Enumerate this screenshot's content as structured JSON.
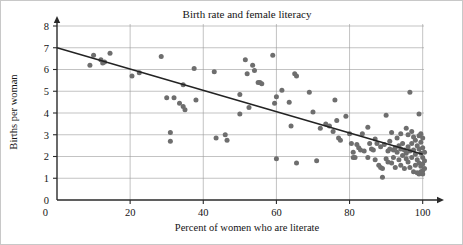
{
  "chart_data": {
    "type": "scatter",
    "title": "Birth rate and female literacy",
    "xlabel": "Percent of women who are literate",
    "ylabel": "Births per woman",
    "xlim": [
      0,
      102
    ],
    "ylim": [
      0,
      8.3
    ],
    "xticks": [
      0,
      20,
      40,
      60,
      80,
      100
    ],
    "yticks": [
      0,
      1,
      2,
      3,
      4,
      5,
      6,
      7,
      8
    ],
    "xtick_labels": [
      "0",
      "20",
      "40",
      "60",
      "80",
      "100"
    ],
    "ytick_labels": [
      "0",
      "1",
      "2",
      "3",
      "4",
      "5",
      "6",
      "7",
      "8"
    ],
    "grid": "horizontal-and-vertical",
    "legend": "none",
    "point_color": "#6e6e6e",
    "line_color": "#232323",
    "trend_line": {
      "label": "least-squares regression line",
      "x_start": 0,
      "y_start": 7.0,
      "x_end": 100,
      "y_end": 2.1,
      "slope": -0.049,
      "intercept": 7.0
    },
    "points": [
      [
        9,
        6.2
      ],
      [
        10,
        6.65
      ],
      [
        12,
        6.45
      ],
      [
        12.5,
        6.3
      ],
      [
        13,
        6.35
      ],
      [
        14.5,
        6.75
      ],
      [
        20.5,
        5.7
      ],
      [
        22.5,
        5.85
      ],
      [
        28.5,
        6.6
      ],
      [
        30,
        4.7
      ],
      [
        31,
        3.1
      ],
      [
        31,
        2.7
      ],
      [
        32,
        4.7
      ],
      [
        33.5,
        4.45
      ],
      [
        34.5,
        5.3
      ],
      [
        34.5,
        4.3
      ],
      [
        35,
        4.15
      ],
      [
        37.5,
        6.05
      ],
      [
        38,
        4.6
      ],
      [
        43,
        5.9
      ],
      [
        43.5,
        2.85
      ],
      [
        46,
        3.0
      ],
      [
        46.5,
        2.75
      ],
      [
        50,
        4.85
      ],
      [
        50,
        3.95
      ],
      [
        51.5,
        6.45
      ],
      [
        52,
        5.8
      ],
      [
        52.5,
        4.25
      ],
      [
        53.5,
        6.2
      ],
      [
        54,
        5.95
      ],
      [
        55,
        5.4
      ],
      [
        55.5,
        5.4
      ],
      [
        56,
        5.35
      ],
      [
        59,
        6.65
      ],
      [
        59.5,
        4.45
      ],
      [
        60,
        4.75
      ],
      [
        60,
        1.9
      ],
      [
        61.5,
        5.05
      ],
      [
        63.5,
        4.5
      ],
      [
        64,
        3.4
      ],
      [
        65,
        5.8
      ],
      [
        65.5,
        5.7
      ],
      [
        65.5,
        1.7
      ],
      [
        69,
        4.95
      ],
      [
        70,
        4.05
      ],
      [
        71,
        1.8
      ],
      [
        72,
        3.3
      ],
      [
        73.5,
        3.5
      ],
      [
        74.5,
        3.4
      ],
      [
        75.5,
        3.15
      ],
      [
        76,
        4.6
      ],
      [
        76.5,
        3.65
      ],
      [
        77,
        2.85
      ],
      [
        77.5,
        2.75
      ],
      [
        79,
        3.85
      ],
      [
        80,
        3.05
      ],
      [
        80.5,
        2.6
      ],
      [
        81,
        2.2
      ],
      [
        81,
        1.95
      ],
      [
        81.5,
        1.95
      ],
      [
        82,
        2.55
      ],
      [
        82.5,
        2.4
      ],
      [
        83,
        2.3
      ],
      [
        83.5,
        3.05
      ],
      [
        84,
        2.25
      ],
      [
        85,
        3.35
      ],
      [
        85.5,
        2.6
      ],
      [
        86,
        2.35
      ],
      [
        86.5,
        2.3
      ],
      [
        87,
        1.85
      ],
      [
        87.5,
        2.6
      ],
      [
        88,
        1.6
      ],
      [
        88.5,
        1.5
      ],
      [
        88.5,
        2.45
      ],
      [
        89,
        1.05
      ],
      [
        89,
        1.45
      ],
      [
        89.5,
        2.55
      ],
      [
        90,
        3.9
      ],
      [
        90,
        1.9
      ],
      [
        90.5,
        2.25
      ],
      [
        90.5,
        1.75
      ],
      [
        91,
        2.7
      ],
      [
        91,
        2.35
      ],
      [
        91.5,
        3.1
      ],
      [
        91.5,
        1.7
      ],
      [
        92,
        2.3
      ],
      [
        92,
        1.95
      ],
      [
        92.5,
        2.4
      ],
      [
        92.5,
        1.5
      ],
      [
        93,
        2.85
      ],
      [
        93,
        2.2
      ],
      [
        93.5,
        2.5
      ],
      [
        93.5,
        1.85
      ],
      [
        94,
        2.35
      ],
      [
        94,
        1.6
      ],
      [
        94.5,
        2.6
      ],
      [
        94.5,
        2.05
      ],
      [
        95,
        2.3
      ],
      [
        95,
        1.45
      ],
      [
        95.5,
        3.3
      ],
      [
        95.5,
        2.15
      ],
      [
        95.5,
        1.9
      ],
      [
        96,
        2.45
      ],
      [
        96,
        1.75
      ],
      [
        96.5,
        4.95
      ],
      [
        96.5,
        2.25
      ],
      [
        96.5,
        1.5
      ],
      [
        97,
        3.15
      ],
      [
        97,
        2.6
      ],
      [
        97,
        1.95
      ],
      [
        97.5,
        2.9
      ],
      [
        97.5,
        2.3
      ],
      [
        97.5,
        1.3
      ],
      [
        98,
        2.75
      ],
      [
        98,
        2.1
      ],
      [
        98,
        1.6
      ],
      [
        98.5,
        2.5
      ],
      [
        98.5,
        1.85
      ],
      [
        98.5,
        1.25
      ],
      [
        99,
        3.95
      ],
      [
        99,
        2.95
      ],
      [
        99,
        2.35
      ],
      [
        99,
        1.7
      ],
      [
        99,
        1.2
      ],
      [
        99.5,
        2.65
      ],
      [
        99.5,
        2.15
      ],
      [
        99.5,
        1.55
      ],
      [
        99.5,
        1.3
      ],
      [
        100,
        2.85
      ],
      [
        100,
        2.4
      ],
      [
        100,
        1.95
      ],
      [
        100,
        1.65
      ],
      [
        100,
        1.35
      ],
      [
        100,
        1.2
      ],
      [
        100.5,
        2.2
      ],
      [
        100.5,
        1.8
      ],
      [
        100.5,
        1.45
      ],
      [
        85,
        1.95
      ],
      [
        87,
        2.8
      ],
      [
        94,
        3.05
      ],
      [
        96,
        3.0
      ],
      [
        99.5,
        3.05
      ]
    ]
  }
}
